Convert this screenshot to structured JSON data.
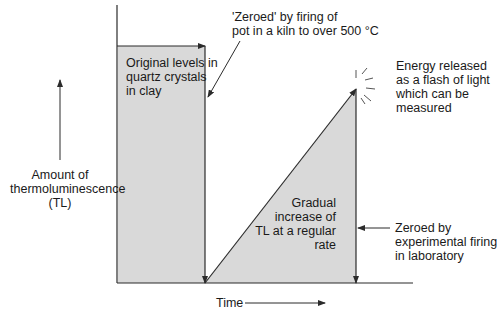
{
  "diagram": {
    "axes": {
      "y_label": [
        "Amount of",
        "thermoluminescence",
        "(TL)"
      ],
      "x_label": "Time"
    },
    "regions": {
      "original": [
        "Original levels in",
        "quartz crystals",
        "in clay"
      ],
      "gradual": [
        "Gradual",
        "increase of",
        "TL at a regular",
        "rate"
      ]
    },
    "annotations": {
      "zeroed_kiln": [
        "'Zeroed' by firing of",
        "pot in a kiln to over 500 °C"
      ],
      "energy": [
        "Energy released",
        "as a flash of light",
        "which can be",
        "measured"
      ],
      "zeroed_lab": [
        "Zeroed by",
        "experimental firing",
        "in laboratory"
      ]
    },
    "colors": {
      "fill": "#d9d9d9",
      "line": "#2b2b2b",
      "text": "#1a1a1a"
    }
  }
}
